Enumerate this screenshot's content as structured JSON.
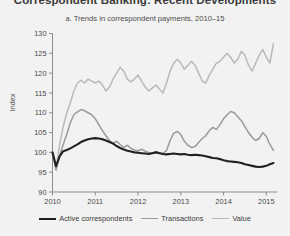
{
  "figure": {
    "cut_off_title": "Correspondent Banking: Recent Developments",
    "subtitle": "a. Trends in correspondent payments, 2010–15",
    "ylabel": "Index"
  },
  "colors": {
    "background": "#f2f2f2",
    "axis": "#8c8c8c",
    "text": "#4a4a4a",
    "active_correspondents": "#231f20",
    "transactions": "#9a9a9a",
    "value": "#b9b9b9"
  },
  "legend": {
    "position": "bottom",
    "items": [
      {
        "label": "Active correspondents",
        "color": "#231f20",
        "width": 2.1
      },
      {
        "label": "Transactions",
        "color": "#9a9a9a",
        "width": 1.5
      },
      {
        "label": "Value",
        "color": "#b9b9b9",
        "width": 1.5
      }
    ]
  },
  "chart_data": {
    "type": "line",
    "title": "a. Trends in correspondent payments, 2010–15",
    "xlabel": "",
    "ylabel": "Index",
    "xlim": [
      2010,
      2015.25
    ],
    "ylim": [
      90,
      130
    ],
    "yticks": [
      90,
      95,
      100,
      105,
      110,
      115,
      120,
      125,
      130
    ],
    "xticks": [
      2010,
      2011,
      2012,
      2013,
      2014,
      2015
    ],
    "xtick_labels": [
      "2010",
      "2011",
      "2012",
      "2013",
      "2014",
      "2015"
    ],
    "grid": false,
    "legend_position": "bottom",
    "x": [
      2010.0,
      2010.083,
      2010.167,
      2010.25,
      2010.333,
      2010.417,
      2010.5,
      2010.583,
      2010.667,
      2010.75,
      2010.833,
      2010.917,
      2011.0,
      2011.083,
      2011.167,
      2011.25,
      2011.333,
      2011.417,
      2011.5,
      2011.583,
      2011.667,
      2011.75,
      2011.833,
      2011.917,
      2012.0,
      2012.083,
      2012.167,
      2012.25,
      2012.333,
      2012.417,
      2012.5,
      2012.583,
      2012.667,
      2012.75,
      2012.833,
      2012.917,
      2013.0,
      2013.083,
      2013.167,
      2013.25,
      2013.333,
      2013.417,
      2013.5,
      2013.583,
      2013.667,
      2013.75,
      2013.833,
      2013.917,
      2014.0,
      2014.083,
      2014.167,
      2014.25,
      2014.333,
      2014.417,
      2014.5,
      2014.583,
      2014.667,
      2014.75,
      2014.833,
      2014.917,
      2015.0,
      2015.083,
      2015.167
    ],
    "series": [
      {
        "name": "Active correspondents",
        "color": "#231f20",
        "width": 2.1,
        "values": [
          100.0,
          96.5,
          99.0,
          100.3,
          100.6,
          101.0,
          101.5,
          102.0,
          102.6,
          103.0,
          103.3,
          103.5,
          103.6,
          103.5,
          103.3,
          103.0,
          102.6,
          102.2,
          101.6,
          101.1,
          100.7,
          100.4,
          100.2,
          100.0,
          99.9,
          99.8,
          99.7,
          99.6,
          99.8,
          100.0,
          99.8,
          99.6,
          99.5,
          99.6,
          99.7,
          99.6,
          99.5,
          99.6,
          99.4,
          99.3,
          99.4,
          99.3,
          99.2,
          99.0,
          98.8,
          98.6,
          98.5,
          98.3,
          98.0,
          97.8,
          97.7,
          97.6,
          97.5,
          97.3,
          97.0,
          96.8,
          96.6,
          96.4,
          96.3,
          96.4,
          96.6,
          97.0,
          97.3
        ]
      },
      {
        "name": "Transactions",
        "color": "#9a9a9a",
        "width": 1.5,
        "values": [
          100.0,
          95.5,
          99.2,
          102.0,
          104.5,
          107.5,
          109.5,
          110.2,
          110.8,
          110.5,
          110.0,
          109.5,
          108.5,
          107.0,
          105.5,
          104.2,
          103.0,
          102.3,
          102.8,
          102.0,
          101.2,
          101.8,
          101.0,
          100.6,
          100.4,
          100.8,
          100.3,
          100.0,
          99.8,
          100.2,
          99.9,
          99.7,
          100.5,
          103.0,
          104.8,
          105.3,
          104.5,
          102.8,
          101.8,
          101.2,
          101.5,
          102.5,
          103.5,
          104.2,
          105.5,
          106.3,
          105.8,
          107.0,
          108.5,
          109.5,
          110.3,
          110.0,
          109.0,
          108.0,
          106.5,
          105.0,
          103.8,
          103.0,
          103.5,
          105.0,
          104.0,
          102.0,
          100.5
        ]
      },
      {
        "name": "Value",
        "color": "#b9b9b9",
        "width": 1.5,
        "values": [
          100.0,
          96.0,
          102.0,
          106.5,
          110.0,
          112.5,
          115.5,
          117.5,
          118.2,
          117.5,
          118.5,
          118.0,
          117.5,
          118.0,
          117.0,
          115.5,
          116.5,
          118.5,
          120.0,
          121.5,
          120.5,
          118.5,
          117.8,
          118.5,
          119.5,
          118.0,
          116.5,
          115.5,
          116.2,
          117.0,
          116.0,
          115.0,
          117.5,
          120.5,
          122.5,
          123.5,
          122.5,
          121.0,
          122.0,
          123.0,
          122.0,
          120.0,
          118.0,
          117.5,
          119.5,
          121.0,
          122.5,
          123.0,
          124.0,
          125.0,
          124.0,
          122.5,
          123.5,
          125.5,
          124.5,
          122.0,
          120.5,
          122.5,
          124.5,
          126.0,
          124.0,
          122.5,
          127.5
        ]
      }
    ]
  }
}
